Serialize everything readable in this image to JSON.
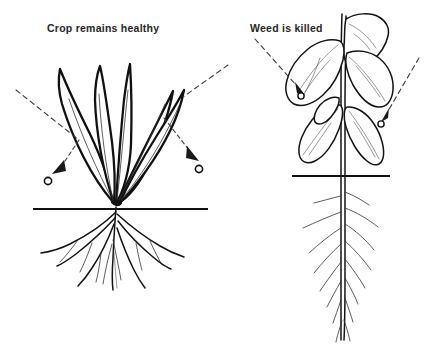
{
  "figure": {
    "background_color": "#ffffff",
    "ink_color": "#111111",
    "panels": [
      {
        "id": "left",
        "caption": "Crop remains healthy",
        "plant_type": "grass crop",
        "leaf_shape": "narrow upright blades",
        "root_type": "fibrous spreading roots",
        "spray_behavior": "droplets roll off the leaves",
        "droplet_label": "o",
        "droplet_count": 2
      },
      {
        "id": "right",
        "caption": "Weed is killed",
        "plant_type": "broadleaf weed",
        "leaf_shape": "broad wilted drooping leaves",
        "root_type": "taproot with laterals",
        "spray_behavior": "droplets stick and are absorbed",
        "droplet_label": "o",
        "droplet_count": 2
      }
    ],
    "ground_line_label": "soil surface"
  }
}
